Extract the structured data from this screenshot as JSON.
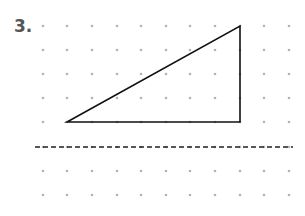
{
  "problem": {
    "number": "3."
  },
  "grid": {
    "columns_x": [
      43,
      67,
      92,
      117,
      141,
      166,
      190,
      215,
      240,
      264,
      289
    ],
    "rows_y": [
      26,
      50,
      74,
      98,
      122,
      147,
      171,
      195
    ],
    "dot_color": "#b3b3b3"
  },
  "triangle": {
    "vertices": [
      [
        67,
        122
      ],
      [
        240,
        122
      ],
      [
        240,
        26
      ]
    ],
    "stroke": "#111111"
  },
  "reflection_line": {
    "x1": 35,
    "x2": 293,
    "y": 147,
    "stroke": "#222222",
    "style": "dashed"
  }
}
